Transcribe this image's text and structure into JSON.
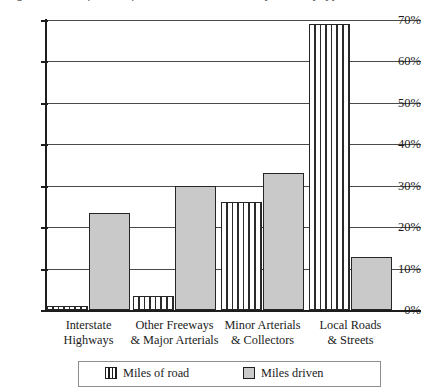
{
  "title": {
    "text": "Figure: Share of miles of road and miles driven, by roadway type",
    "cropped": true
  },
  "chart_data": {
    "type": "bar",
    "title": "",
    "xlabel": "",
    "ylabel": "",
    "ylim": [
      0,
      70
    ],
    "ytick_labels": [
      "0%",
      "10%",
      "20%",
      "30%",
      "40%",
      "50%",
      "60%",
      "70%"
    ],
    "ytick_values": [
      0,
      10,
      20,
      30,
      40,
      50,
      60,
      70
    ],
    "grid": true,
    "legend_position": "bottom",
    "categories": [
      "Interstate\nHighways",
      "Other Freeways\n& Major Arterials",
      "Minor Arterials\n& Collectors",
      "Local Roads\n& Streets"
    ],
    "category_lines": [
      [
        "Interstate",
        "Highways"
      ],
      [
        "Other Freeways",
        "& Major Arterials"
      ],
      [
        "Minor Arterials",
        "& Collectors"
      ],
      [
        "Local Roads",
        "& Streets"
      ]
    ],
    "series": [
      {
        "name": "Miles of road",
        "pattern": "vertical-stripes",
        "color": "#ffffff",
        "values": [
          1.0,
          3.5,
          26.0,
          69.0
        ]
      },
      {
        "name": "Miles driven",
        "pattern": "solid",
        "color": "#c9c9c9",
        "values": [
          23.5,
          30.0,
          33.0,
          12.8
        ]
      }
    ]
  },
  "legend": {
    "entries": [
      {
        "label": "Miles of road",
        "pattern": "vertical-stripes"
      },
      {
        "label": "Miles driven",
        "pattern": "solid"
      }
    ]
  },
  "colors": {
    "bar_fill_solid": "#c9c9c9",
    "bar_stroke": "#262626",
    "axis": "#1d1d1d",
    "gridline": "#4a4a4a",
    "text": "#1b1b1b",
    "legend_border": "#8d8d8d",
    "background": "#ffffff"
  }
}
